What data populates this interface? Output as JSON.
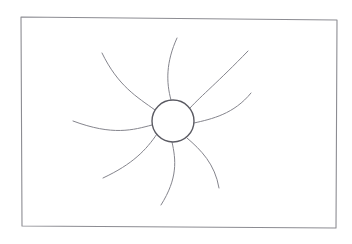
{
  "artwork": {
    "title": "Spiral pinwheel sun sketch",
    "medium": "hand-drawn line art",
    "background_color": "#ffffff",
    "line_color": "#85858d",
    "hub_line_color": "#5a5a62",
    "frame_line_color": "#8c8c92"
  },
  "canvas": {
    "width": 352,
    "height": 244
  },
  "frame": {
    "name": "border-rectangle",
    "points": "21,17 337,20 336,228 22,226",
    "stroke_width": 1.1
  },
  "hub": {
    "name": "center-circle",
    "cx": 173,
    "cy": 121,
    "r": 21,
    "stroke_width": 1.4
  },
  "rays": [
    {
      "id": "ray-n",
      "label": "north ray",
      "path": "M 171 100 C 166 82 166 62 177 38"
    },
    {
      "id": "ray-nw",
      "label": "northwest ray",
      "path": "M 155 110 C 137 97 118 86 102 53"
    },
    {
      "id": "ray-w",
      "label": "west ray",
      "path": "M 152 125 C 133 130 113 136 73 121"
    },
    {
      "id": "ray-sw",
      "label": "southwest ray",
      "path": "M 157 134 C 146 150 133 164 103 178"
    },
    {
      "id": "ray-s",
      "label": "south ray",
      "path": "M 172 142 C 176 160 178 178 161 205"
    },
    {
      "id": "ray-se",
      "label": "southeast ray",
      "path": "M 187 138 C 201 150 215 164 219 188"
    },
    {
      "id": "ray-e",
      "label": "east ray",
      "path": "M 194 123 C 212 119 234 114 251 93"
    },
    {
      "id": "ray-ne",
      "label": "northeast ray",
      "path": "M 190 108 C 202 95 218 82 248 51"
    }
  ]
}
